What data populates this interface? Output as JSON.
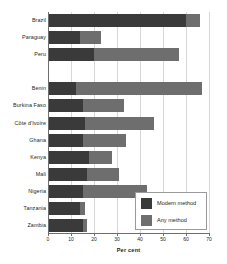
{
  "chart_data": {
    "type": "bar",
    "orientation": "horizontal",
    "title": "",
    "subtitle": "",
    "xlabel": "Per cent",
    "ylabel": "",
    "xlim": [
      0,
      70
    ],
    "xticks": [
      0,
      10,
      20,
      30,
      40,
      50,
      60,
      70
    ],
    "xtick_labels": [
      "0",
      "10",
      "20",
      "30",
      "40",
      "50",
      "60",
      "70"
    ],
    "grid": "vertical",
    "legend_position": "bottom-right",
    "bar_style": "overlapping",
    "categories": [
      "Brazil",
      "Paraguay",
      "Peru",
      "",
      "Benin",
      "Burkina Faso",
      "Côte d'Ivoire",
      "Ghana",
      "Kenya",
      "Mali",
      "Nigeria",
      "Tanzania",
      "Zambia"
    ],
    "series": [
      {
        "name": "Any method",
        "color": "#6e6e6e",
        "values": [
          66,
          23,
          57,
          null,
          67,
          33,
          46,
          34,
          28,
          31,
          43,
          16,
          17
        ]
      },
      {
        "name": "Modern method",
        "color": "#3a3a3a",
        "values": [
          60,
          14,
          20,
          null,
          12,
          15,
          16,
          15,
          18,
          17,
          15,
          14,
          15
        ]
      }
    ],
    "legend": [
      {
        "label": "Modern method",
        "swatch": "dark"
      },
      {
        "label": "Any method",
        "swatch": "light"
      }
    ]
  },
  "colors": {
    "modern_method": "#3a3a3a",
    "any_method": "#6e6e6e",
    "axis": "#6d6e70",
    "gridline": "#d6d7d9",
    "text": "#231f20",
    "background": "#ffffff"
  }
}
